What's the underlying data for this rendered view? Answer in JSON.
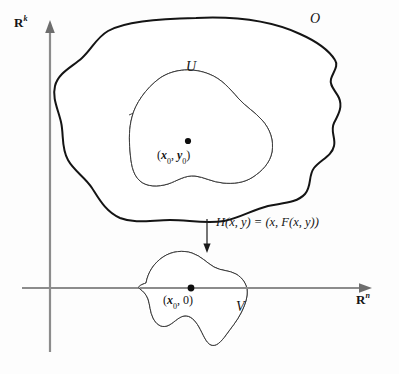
{
  "figure": {
    "caption_present": false,
    "background_color": "#fdfdfd",
    "ink_color": "#141414",
    "shade_color": "#b5b5b5",
    "axis_color": "#8c8c8c"
  },
  "axes": {
    "vertical": {
      "name": "R^k",
      "base": "R",
      "exponent": "k",
      "label_x": 14,
      "label_y": 16,
      "x": 50,
      "y_top": 22,
      "y_bottom": 352
    },
    "horizontal": {
      "name": "R^n",
      "base": "R",
      "exponent": "n",
      "label_x": 356,
      "label_y": 294,
      "y": 288,
      "x_left": 22,
      "x_right": 372
    }
  },
  "regions": {
    "outer_set": {
      "label": "O",
      "label_x": 310,
      "label_y": 14,
      "stroke_width": 2.0,
      "fill": "#ffffff",
      "description": "large open set in R^n x R^k"
    },
    "inner_set": {
      "label": "U",
      "label_x": 186,
      "label_y": 62,
      "stroke_width": 1.0,
      "fill": "#ffffff",
      "shaded_fill": "#b5b5b5",
      "description": "neighborhood U inside O, upper portion shaded"
    },
    "image_set": {
      "label": "V",
      "label_x": 236,
      "label_y": 309,
      "stroke_width": 1.0,
      "fill": "#ffffff",
      "shaded_fill": "#b5b5b5",
      "description": "image V under H, shaded above the R^n axis"
    }
  },
  "points": [
    {
      "name": "point-x0-y0",
      "label": "(x0, y0)",
      "label_parts": {
        "open": "(",
        "x": "x",
        "xsub": "0",
        "comma": ", ",
        "y": "y",
        "ysub": "0",
        "close": ")"
      },
      "dot_x": 188,
      "dot_y": 141,
      "label_x": 158,
      "label_y": 149
    },
    {
      "name": "point-x0-zero",
      "label": "(x0, 0)",
      "label_parts": {
        "open": "(",
        "x": "x",
        "xsub": "0",
        "comma": ", ",
        "y": "0",
        "ysub": "",
        "close": ")"
      },
      "dot_x": 191,
      "dot_y": 288,
      "label_x": 164,
      "label_y": 294
    }
  ],
  "map": {
    "name": "H",
    "formula": "H(x, y) = (x, F(x, y))",
    "label_x": 216,
    "label_y": 222,
    "arrow": {
      "x": 207,
      "y_start": 219,
      "y_end": 252
    }
  }
}
